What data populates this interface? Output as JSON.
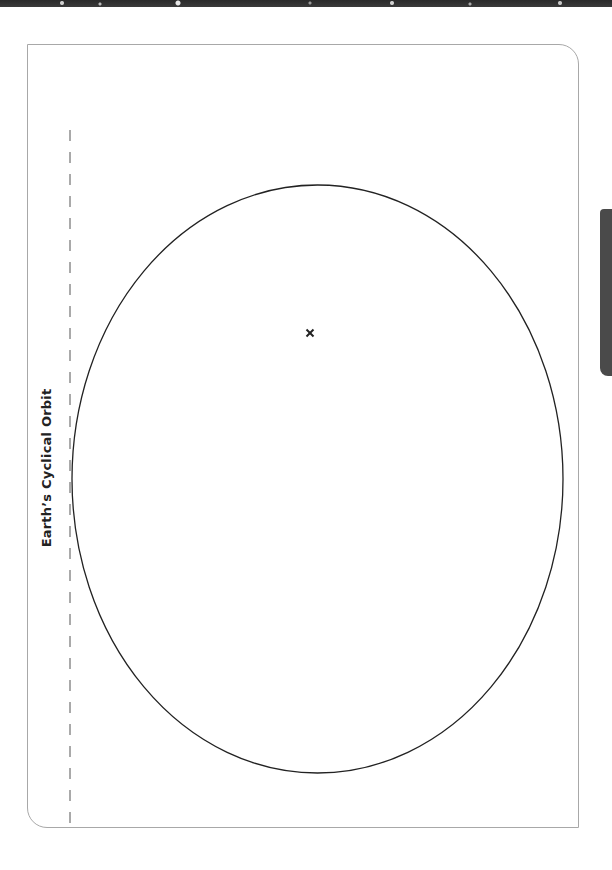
{
  "worksheet": {
    "title": "Earth’s Cyclical Orbit"
  },
  "diagram": {
    "orbit": {
      "shape": "ellipse",
      "cx": 317.5,
      "cy": 479,
      "rx": 245.5,
      "ry": 294,
      "stroke": "#222222"
    },
    "focus_marker": {
      "label": "x",
      "x": 310,
      "y": 333
    },
    "dashed_line": {
      "x": 70,
      "y1": 130,
      "y2": 824,
      "stroke": "#555555"
    }
  },
  "colors": {
    "border": "#a8a8a8",
    "side_tab": "#4a4a4a",
    "ink": "#222222"
  }
}
